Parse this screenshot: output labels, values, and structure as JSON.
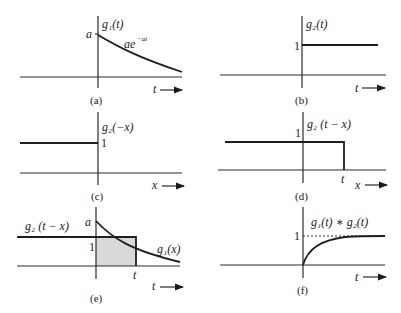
{
  "figure": {
    "panels": [
      {
        "id": "a",
        "caption": "(a)",
        "function_label": "g₁(t)",
        "curve_label": "ae",
        "curve_exponent": "−at",
        "y_tick": "a",
        "x_axis_label": "t →"
      },
      {
        "id": "b",
        "caption": "(b)",
        "function_label": "g₂(t)",
        "y_tick": "1",
        "x_axis_label": "t →"
      },
      {
        "id": "c",
        "caption": "(c)",
        "function_label": "g₂(−x)",
        "y_tick": "1",
        "x_axis_label": "x →"
      },
      {
        "id": "d",
        "caption": "(d)",
        "function_label": "g₂ (t − x)",
        "y_tick": "1",
        "x_tick": "t",
        "x_axis_label": "x →"
      },
      {
        "id": "e",
        "caption": "(e)",
        "function_label_left": "g₂ (t − x)",
        "function_label_right": "g₁(x)",
        "y_tick_top": "a",
        "y_tick": "1",
        "x_tick": "t",
        "x_axis_label": "t →"
      },
      {
        "id": "f",
        "caption": "(f)",
        "function_label": "g₁(t) ∗ g₂(t)",
        "y_tick": "1",
        "x_axis_label": "t →"
      }
    ],
    "colors": {
      "line": "#1e1e1e",
      "shade": "#d9d9d9"
    }
  }
}
